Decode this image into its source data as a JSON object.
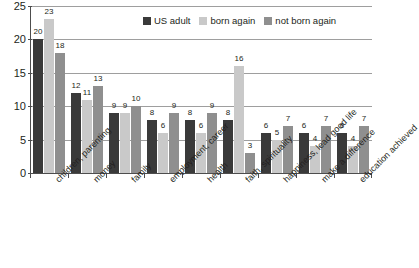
{
  "chart_data": {
    "type": "bar",
    "title": "",
    "xlabel": "",
    "ylabel": "",
    "ylim": [
      0,
      25
    ],
    "yticks": [
      0,
      5,
      10,
      15,
      20,
      25
    ],
    "grid": true,
    "legend_position": "top-center",
    "categories": [
      "children, parenting",
      "money",
      "family",
      "employment, career",
      "health",
      "faith, spirituality",
      "happiness, lead good life",
      "make a difference",
      "education achieved"
    ],
    "series": [
      {
        "name": "US adult",
        "color": "#3a3a3a",
        "values": [
          20,
          12,
          9,
          8,
          8,
          8,
          6,
          6,
          6
        ]
      },
      {
        "name": "born again",
        "color": "#c9c9c9",
        "values": [
          23,
          11,
          9,
          6,
          6,
          16,
          5,
          4,
          4
        ]
      },
      {
        "name": "not born again",
        "color": "#8f8f8f",
        "values": [
          18,
          13,
          10,
          9,
          9,
          3,
          7,
          7,
          7
        ]
      }
    ]
  }
}
